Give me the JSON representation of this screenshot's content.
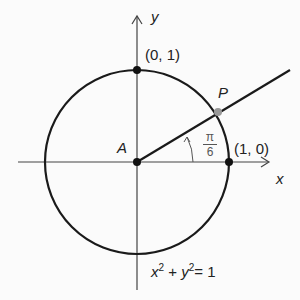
{
  "diagram": {
    "axes": {
      "x_label": "x",
      "y_label": "y"
    },
    "center": {
      "label": "A"
    },
    "points": [
      {
        "name": "top",
        "label": "(0, 1)"
      },
      {
        "name": "right",
        "label": "(1, 0)"
      },
      {
        "name": "P",
        "label": "P"
      }
    ],
    "angle": {
      "numerator": "π",
      "denominator": "6"
    },
    "equation": {
      "x": "x",
      "y": "y",
      "exp": "2",
      "plus": " + ",
      "rhs": "= 1"
    },
    "colors": {
      "stroke": "#1a1a1a",
      "axis": "#444444",
      "point_p": "#999999"
    }
  }
}
